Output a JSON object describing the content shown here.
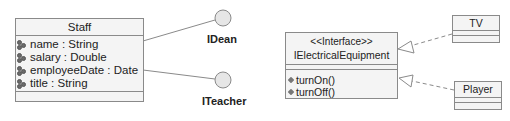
{
  "diagram": {
    "staff": {
      "name": "Staff",
      "attributes": [
        {
          "name": "name",
          "type": "String",
          "text": "name : String"
        },
        {
          "name": "salary",
          "type": "Double",
          "text": "salary : Double"
        },
        {
          "name": "employeeDate",
          "type": "Date",
          "text": "employeeDate : Date"
        },
        {
          "name": "title",
          "type": "String",
          "text": "title : String"
        }
      ],
      "attribute_icon": "attribute-icon",
      "realizes": [
        "IDean",
        "ITeacher"
      ]
    },
    "lollipops": [
      {
        "label": "IDean"
      },
      {
        "label": "ITeacher"
      }
    ],
    "interface": {
      "stereotype": "<<Interface>>",
      "name": "IElectricalEquipment",
      "operations": [
        {
          "text": "turnOn()"
        },
        {
          "text": "turnOff()"
        }
      ],
      "operation_icon": "operation-icon"
    },
    "implementers": [
      {
        "name": "TV"
      },
      {
        "name": "Player"
      }
    ],
    "colors": {
      "box_fill": "#f4f4f4",
      "box_border": "#8a8a8a",
      "lollipop_fill": "#e6e6e6",
      "line": "#8a8a8a"
    }
  }
}
